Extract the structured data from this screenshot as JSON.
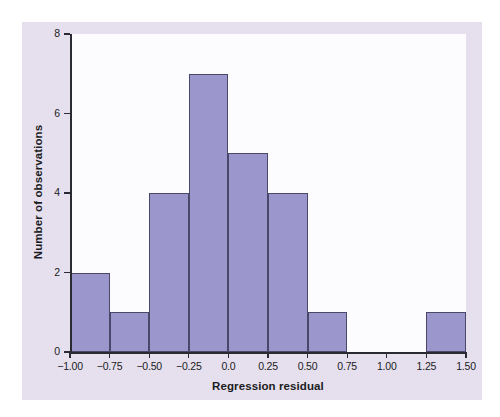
{
  "chart_data": {
    "type": "bar",
    "subtype": "histogram",
    "title": "",
    "xlabel": "Regression residual",
    "ylabel": "Number of observations",
    "xlim": [
      -1.0,
      1.5
    ],
    "ylim": [
      0,
      8
    ],
    "bin_width": 0.25,
    "grid": false,
    "legend": null,
    "x_tick_labels": [
      "−1.00",
      "−0.75",
      "−0.50",
      "−0.25",
      "0.0",
      "0.25",
      "0.50",
      "0.75",
      "1.00",
      "1.25",
      "1.50"
    ],
    "x_tick_values": [
      -1.0,
      -0.75,
      -0.5,
      -0.25,
      0.0,
      0.25,
      0.5,
      0.75,
      1.0,
      1.25,
      1.5
    ],
    "y_tick_labels": [
      "0",
      "2",
      "4",
      "6",
      "8"
    ],
    "y_tick_values": [
      0,
      2,
      4,
      6,
      8
    ],
    "bins": [
      {
        "start": -1.0,
        "end": -0.75,
        "count": 2
      },
      {
        "start": -0.75,
        "end": -0.5,
        "count": 1
      },
      {
        "start": -0.5,
        "end": -0.25,
        "count": 4
      },
      {
        "start": -0.25,
        "end": 0.0,
        "count": 7
      },
      {
        "start": 0.0,
        "end": 0.25,
        "count": 5
      },
      {
        "start": 0.25,
        "end": 0.5,
        "count": 4
      },
      {
        "start": 0.5,
        "end": 0.75,
        "count": 1
      },
      {
        "start": 0.75,
        "end": 1.0,
        "count": 0
      },
      {
        "start": 1.0,
        "end": 1.25,
        "count": 0
      },
      {
        "start": 1.25,
        "end": 1.5,
        "count": 1
      }
    ],
    "categories": [
      "-1.00 to -0.75",
      "-0.75 to -0.50",
      "-0.50 to -0.25",
      "-0.25 to 0.00",
      "0.00 to 0.25",
      "0.25 to 0.50",
      "0.50 to 0.75",
      "0.75 to 1.00",
      "1.00 to 1.25",
      "1.25 to 1.50"
    ],
    "values": [
      2,
      1,
      4,
      7,
      5,
      4,
      1,
      0,
      0,
      1
    ],
    "total_observations": 25
  },
  "colors": {
    "bar_fill": "#9b97cd",
    "bar_edge": "#4a4768",
    "panel_background": "#e6e0ee",
    "plot_background": "#fcfbfd",
    "axis": "#2a2a33",
    "text": "#1b1b22",
    "figure_background": "#ffffff"
  }
}
